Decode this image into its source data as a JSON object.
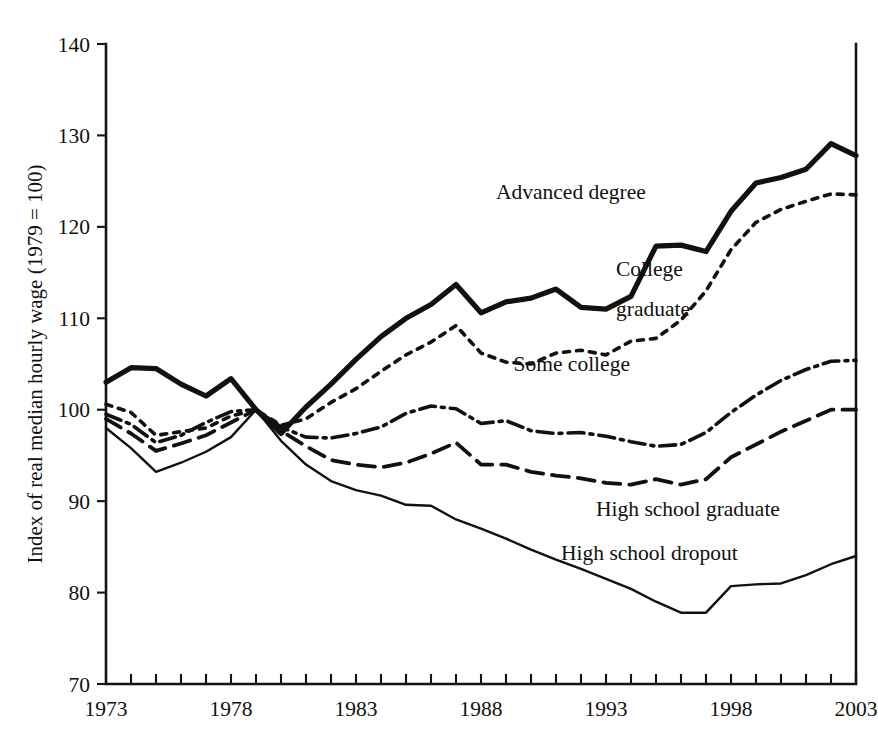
{
  "chart_data": {
    "type": "line",
    "title": "",
    "xlabel": "",
    "ylabel": "Index of real median hourly wage (1979 = 100)",
    "xlim": [
      1973,
      2003
    ],
    "ylim": [
      70,
      140
    ],
    "ytick_labels": [
      "70",
      "80",
      "90",
      "100",
      "110",
      "120",
      "130",
      "140"
    ],
    "ytick_values": [
      70,
      80,
      90,
      100,
      110,
      120,
      130,
      140
    ],
    "xtick_labels": [
      "1973",
      "1978",
      "1983",
      "1988",
      "1993",
      "1998",
      "2003"
    ],
    "xtick_values": [
      1973,
      1978,
      1983,
      1988,
      1993,
      1998,
      2003
    ],
    "minor_xticks_every": 1,
    "grid": false,
    "legend_position": "inline-annotations",
    "x": [
      1973,
      1974,
      1975,
      1976,
      1977,
      1978,
      1979,
      1980,
      1981,
      1982,
      1983,
      1984,
      1985,
      1986,
      1987,
      1988,
      1989,
      1990,
      1991,
      1992,
      1993,
      1994,
      1995,
      1996,
      1997,
      1998,
      1999,
      2000,
      2001,
      2002,
      2003
    ],
    "series": [
      {
        "name": "Advanced degree",
        "style": "thick-solid",
        "stroke_width": 5.2,
        "dash": "none",
        "label_x": 1988.6,
        "label_y": 123.0,
        "values": [
          103.0,
          104.6,
          104.5,
          102.8,
          101.5,
          103.4,
          100.0,
          97.4,
          100.3,
          102.8,
          105.5,
          108.0,
          110.0,
          111.5,
          113.7,
          110.6,
          111.8,
          112.2,
          113.2,
          111.2,
          111.0,
          112.4,
          117.9,
          118.0,
          117.3,
          121.7,
          124.8,
          125.4,
          126.3,
          129.1,
          127.8
        ]
      },
      {
        "name": "College graduate",
        "style": "fine-dotted",
        "stroke_width": 3.6,
        "dash": "6,7",
        "label_x": 1993.4,
        "label_y": 114.6,
        "label_line2_y": 110.2,
        "values": [
          100.6,
          99.7,
          97.2,
          97.6,
          98.0,
          99.3,
          100.0,
          98.3,
          99.0,
          100.8,
          102.3,
          104.2,
          106.0,
          107.4,
          109.2,
          106.2,
          105.2,
          105.0,
          106.2,
          106.5,
          106.0,
          107.5,
          107.8,
          109.8,
          113.0,
          117.5,
          120.5,
          121.9,
          122.8,
          123.6,
          123.5
        ]
      },
      {
        "name": "Some college",
        "style": "dash-dot",
        "stroke_width": 3.6,
        "dash": "16,6,3,6",
        "label_x": 1989.3,
        "label_y": 104.2,
        "values": [
          99.5,
          98.4,
          96.4,
          97.2,
          98.6,
          99.8,
          100.0,
          98.1,
          97.0,
          96.9,
          97.4,
          98.1,
          99.6,
          100.4,
          100.1,
          98.5,
          98.8,
          97.7,
          97.4,
          97.5,
          97.1,
          96.5,
          96.0,
          96.2,
          97.5,
          99.7,
          101.6,
          103.2,
          104.4,
          105.3,
          105.4
        ]
      },
      {
        "name": "High school graduate",
        "style": "dashed",
        "stroke_width": 3.8,
        "dash": "17,9",
        "label_x": 1992.6,
        "label_y": 88.4,
        "values": [
          99.0,
          97.4,
          95.5,
          96.3,
          97.2,
          98.6,
          100.0,
          97.7,
          96.0,
          94.5,
          94.0,
          93.7,
          94.2,
          95.2,
          96.4,
          94.0,
          94.0,
          93.2,
          92.8,
          92.5,
          92.0,
          91.8,
          92.4,
          91.8,
          92.4,
          94.8,
          96.2,
          97.6,
          98.8,
          100.0,
          100.0
        ]
      },
      {
        "name": "High school dropout",
        "style": "thin-solid",
        "stroke_width": 2.4,
        "dash": "none",
        "label_x": 1991.2,
        "label_y": 83.6,
        "values": [
          98.0,
          95.8,
          93.2,
          94.2,
          95.4,
          97.0,
          100.0,
          96.6,
          94.0,
          92.2,
          91.2,
          90.6,
          89.6,
          89.5,
          88.0,
          87.0,
          85.9,
          84.7,
          83.6,
          82.6,
          81.5,
          80.4,
          79.0,
          77.8,
          77.8,
          80.7,
          80.9,
          81.0,
          81.9,
          83.1,
          84.0
        ]
      }
    ]
  }
}
